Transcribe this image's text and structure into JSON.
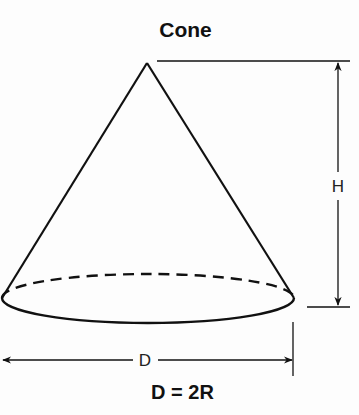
{
  "title": "Cone",
  "labels": {
    "height": "H",
    "diameter": "D"
  },
  "formula": "D = 2R",
  "colors": {
    "stroke": "#111111",
    "background": "#fdfdfd"
  }
}
